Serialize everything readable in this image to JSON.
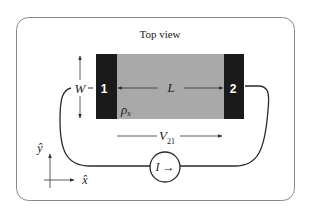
{
  "diagram": {
    "title": "Top view",
    "labels": {
      "width": "W",
      "length": "L",
      "sheet_resistivity": "ρ",
      "sheet_resistivity_sub": "s",
      "voltage": "V",
      "voltage_sub": "21",
      "current": "I →",
      "contact_1": "1",
      "contact_2": "2",
      "y_axis": "ŷ",
      "x_axis": "x̂"
    },
    "colors": {
      "frame": "#8a8a8a",
      "sample": "#a9a9a9",
      "contact": "#1a1a1a",
      "wire": "#2a2a2a",
      "text": "#222222",
      "contact_text": "#ffffff"
    }
  }
}
